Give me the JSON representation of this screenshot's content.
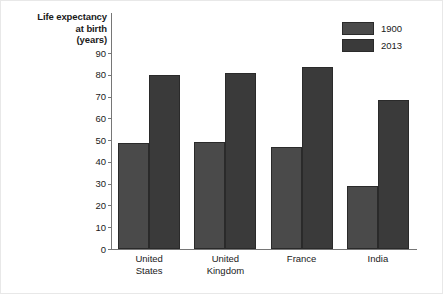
{
  "chart_data": {
    "type": "bar",
    "title": "",
    "subtitle": "",
    "xlabel": "",
    "ylabel": "Life expectancy at birth (years)",
    "ylabel_lines": [
      "Life expectancy",
      "at birth",
      "(years)"
    ],
    "categories": [
      "United States",
      "United Kingdom",
      "France",
      "India"
    ],
    "category_lines": [
      [
        "United",
        "States"
      ],
      [
        "United",
        "Kingdom"
      ],
      [
        "France"
      ],
      [
        "India"
      ]
    ],
    "series": [
      {
        "name": "1900",
        "color": "#4a4a4a",
        "values": [
          48.5,
          49,
          47,
          29
        ]
      },
      {
        "name": "2013",
        "color": "#3a3a3a",
        "values": [
          80,
          81,
          83.5,
          68.5
        ]
      }
    ],
    "ylim": [
      0,
      90
    ],
    "ytick_step": 10,
    "yticks": [
      90,
      80,
      70,
      60,
      50,
      40,
      30,
      20,
      10,
      0
    ],
    "grid": false,
    "legend_position": "top-right"
  }
}
